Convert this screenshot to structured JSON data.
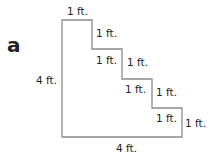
{
  "figure": {
    "letter": "a",
    "shape": "staircase polygon",
    "stroke_color": "#8a8a8a",
    "labels": {
      "top": "1 ft.",
      "step1_right": "1 ft.",
      "step2_top": "1 ft.",
      "step2_right": "1 ft.",
      "step3_top": "1 ft.",
      "step3_right": "1 ft.",
      "step4_top": "1 ft.",
      "step4_right": "1 ft.",
      "left": "4 ft.",
      "bottom": "4 ft."
    }
  }
}
